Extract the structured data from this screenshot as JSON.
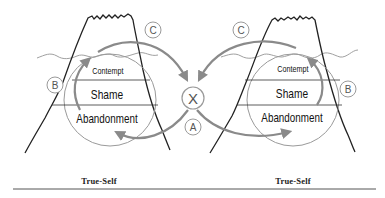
{
  "diagram": {
    "left_panel": {
      "bands": [
        "Contempt",
        "Shame",
        "Abandonment"
      ],
      "markers": {
        "b": "B",
        "c": "C"
      },
      "caption": "True-Self"
    },
    "right_panel": {
      "bands": [
        "Contempt",
        "Shame",
        "Abandonment"
      ],
      "markers": {
        "b": "B",
        "c": "C"
      },
      "caption": "True-Self"
    },
    "center": {
      "cross_marker": "X",
      "a_marker": "A"
    },
    "colors": {
      "outline": "#222222",
      "arrow": "#8a8a8a",
      "circle": "#9a9a9a",
      "water": "#a0a0a0",
      "divider": "#555555"
    }
  }
}
